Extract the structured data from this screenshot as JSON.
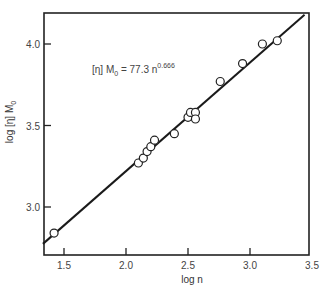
{
  "chart_data": {
    "type": "scatter",
    "title": "",
    "xlabel": "log n",
    "ylabel": "log [η] M₀",
    "ylabel_parts": {
      "prefix": "log [η] M",
      "sub": "0"
    },
    "xlim": [
      1.33,
      3.5
    ],
    "ylim": [
      2.71,
      4.19
    ],
    "xticks": [
      1.5,
      2.0,
      2.5,
      3.0,
      3.5
    ],
    "xtick_labels": [
      "1.5",
      "2.0",
      "2.5",
      "3.0",
      "3.5"
    ],
    "yticks": [
      3.0,
      3.5,
      4.0
    ],
    "ytick_labels": [
      "3.0",
      "3.5",
      "4.0"
    ],
    "grid": false,
    "legend": null,
    "annotation": {
      "text": "[η] M₀ = 77.3 n^0.666",
      "prefix": "[η] M",
      "sub": "0",
      "middle": " = 77.3 n",
      "sup": "0.666"
    },
    "series": [
      {
        "name": "data",
        "marker": "open-circle",
        "x": [
          1.42,
          2.1,
          2.14,
          2.17,
          2.2,
          2.23,
          2.39,
          2.5,
          2.52,
          2.56,
          2.56,
          2.76,
          2.94,
          3.1,
          3.22
        ],
        "y": [
          2.84,
          3.27,
          3.3,
          3.34,
          3.37,
          3.41,
          3.45,
          3.55,
          3.58,
          3.58,
          3.54,
          3.77,
          3.88,
          4.0,
          4.02
        ]
      }
    ],
    "fit_line": {
      "name": "[η] M₀ = 77.3 n^0.666",
      "equation": "log([η]M₀) = log(77.3) + 0.666 log n",
      "slope": 0.666,
      "intercept": 1.888,
      "x_range": [
        1.33,
        3.44
      ]
    }
  }
}
